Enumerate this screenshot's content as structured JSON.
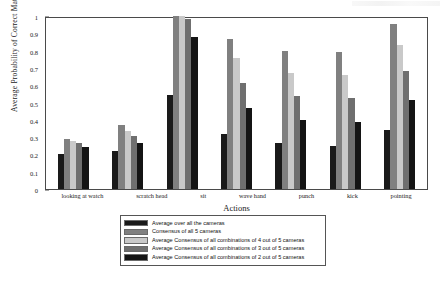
{
  "chart_data": {
    "type": "bar",
    "title": "",
    "xlabel": "Actions",
    "ylabel": "Average Probability of Correct Match",
    "ylim": [
      0,
      1
    ],
    "yticks": [
      "0",
      "0.1",
      "0.2",
      "0.3",
      "0.4",
      "0.5",
      "0.6",
      "0.7",
      "0.8",
      "0.9",
      "1"
    ],
    "grid": false,
    "legend_position": "below-axes",
    "categories": [
      "looking at watch",
      "scratch head",
      "sit",
      "wave hand",
      "punch",
      "kick",
      "pointing"
    ],
    "series": [
      {
        "name": "Average over all the cameras",
        "color": "#1a1a1a",
        "values": [
          0.2,
          0.22,
          0.545,
          0.32,
          0.265,
          0.25,
          0.34
        ]
      },
      {
        "name": "Consensus of all 5 cameras",
        "color": "#808080",
        "values": [
          0.29,
          0.37,
          1.0,
          0.87,
          0.795,
          0.79,
          0.955
        ]
      },
      {
        "name": "Average Consensus of all combinations of 4 out of 5 cameras",
        "color": "#c9c9c9",
        "values": [
          0.28,
          0.335,
          1.0,
          0.755,
          0.67,
          0.66,
          0.835
        ]
      },
      {
        "name": "Average Consensus of all combinations of 3 out of 5 cameras",
        "color": "#6f6f6f",
        "values": [
          0.265,
          0.305,
          0.98,
          0.615,
          0.535,
          0.525,
          0.68
        ]
      },
      {
        "name": "Average Consensus of all combinations of 2 out of 5 cameras",
        "color": "#141414",
        "values": [
          0.24,
          0.265,
          0.88,
          0.47,
          0.4,
          0.385,
          0.515
        ]
      }
    ]
  }
}
